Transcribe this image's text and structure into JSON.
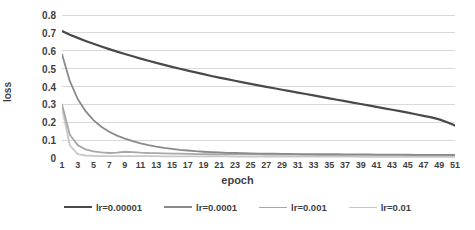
{
  "chart_data": {
    "type": "line",
    "title": "",
    "xlabel": "epoch",
    "ylabel": "loss",
    "xlim": [
      1,
      51
    ],
    "ylim": [
      0,
      0.8
    ],
    "grid": "horizontal",
    "legend_position": "bottom",
    "y_ticks": [
      "0.8",
      "0.7",
      "0.6",
      "0.5",
      "0.4",
      "0.3",
      "0.2",
      "0.1",
      "0"
    ],
    "y_tick_values": [
      0.8,
      0.7,
      0.6,
      0.5,
      0.4,
      0.3,
      0.2,
      0.1,
      0
    ],
    "x_ticks": [
      "1",
      "3",
      "5",
      "7",
      "9",
      "11",
      "13",
      "15",
      "17",
      "19",
      "21",
      "23",
      "25",
      "27",
      "29",
      "31",
      "33",
      "35",
      "37",
      "39",
      "41",
      "43",
      "45",
      "47",
      "49",
      "51"
    ],
    "x": [
      1,
      2,
      3,
      4,
      5,
      6,
      7,
      8,
      9,
      10,
      11,
      12,
      13,
      14,
      15,
      16,
      17,
      18,
      19,
      20,
      21,
      22,
      23,
      24,
      25,
      26,
      27,
      28,
      29,
      30,
      31,
      32,
      33,
      34,
      35,
      36,
      37,
      38,
      39,
      40,
      41,
      42,
      43,
      44,
      45,
      46,
      47,
      48,
      49,
      50,
      51
    ],
    "series": [
      {
        "name": "lr=0.00001",
        "color": "#4a4a4a",
        "width": 2.2,
        "values": [
          0.71,
          0.69,
          0.672,
          0.655,
          0.639,
          0.624,
          0.609,
          0.595,
          0.582,
          0.569,
          0.556,
          0.544,
          0.532,
          0.521,
          0.51,
          0.499,
          0.489,
          0.479,
          0.469,
          0.459,
          0.45,
          0.441,
          0.432,
          0.423,
          0.415,
          0.406,
          0.398,
          0.39,
          0.382,
          0.374,
          0.366,
          0.358,
          0.35,
          0.342,
          0.334,
          0.326,
          0.318,
          0.31,
          0.302,
          0.294,
          0.286,
          0.278,
          0.27,
          0.262,
          0.254,
          0.245,
          0.236,
          0.227,
          0.216,
          0.2,
          0.182
        ]
      },
      {
        "name": "lr=0.0001",
        "color": "#8a8a8a",
        "width": 1.8,
        "values": [
          0.58,
          0.43,
          0.33,
          0.262,
          0.212,
          0.175,
          0.147,
          0.125,
          0.108,
          0.094,
          0.082,
          0.072,
          0.064,
          0.057,
          0.051,
          0.046,
          0.042,
          0.038,
          0.035,
          0.033,
          0.031,
          0.029,
          0.028,
          0.027,
          0.026,
          0.025,
          0.024,
          0.024,
          0.023,
          0.023,
          0.022,
          0.022,
          0.022,
          0.021,
          0.021,
          0.021,
          0.02,
          0.02,
          0.02,
          0.02,
          0.019,
          0.019,
          0.019,
          0.019,
          0.019,
          0.018,
          0.018,
          0.018,
          0.018,
          0.018,
          0.017
        ]
      },
      {
        "name": "lr=0.001",
        "color": "#a8a8a8",
        "width": 1.8,
        "values": [
          0.3,
          0.13,
          0.072,
          0.048,
          0.037,
          0.031,
          0.028,
          0.03,
          0.035,
          0.033,
          0.03,
          0.028,
          0.027,
          0.026,
          0.025,
          0.024,
          0.023,
          0.022,
          0.022,
          0.021,
          0.021,
          0.021,
          0.02,
          0.02,
          0.02,
          0.02,
          0.019,
          0.019,
          0.019,
          0.019,
          0.019,
          0.018,
          0.018,
          0.018,
          0.018,
          0.018,
          0.018,
          0.017,
          0.017,
          0.017,
          0.017,
          0.017,
          0.017,
          0.017,
          0.016,
          0.016,
          0.016,
          0.016,
          0.016,
          0.016,
          0.016
        ]
      },
      {
        "name": "lr=0.01",
        "color": "#c8c8c8",
        "width": 1.8,
        "values": [
          0.28,
          0.07,
          0.022,
          0.014,
          0.012,
          0.011,
          0.011,
          0.01,
          0.01,
          0.01,
          0.01,
          0.01,
          0.01,
          0.009,
          0.009,
          0.009,
          0.009,
          0.009,
          0.009,
          0.009,
          0.009,
          0.009,
          0.008,
          0.008,
          0.008,
          0.008,
          0.008,
          0.008,
          0.008,
          0.008,
          0.008,
          0.008,
          0.008,
          0.008,
          0.008,
          0.008,
          0.008,
          0.008,
          0.007,
          0.007,
          0.007,
          0.007,
          0.007,
          0.007,
          0.007,
          0.007,
          0.007,
          0.007,
          0.007,
          0.007,
          0.007
        ]
      }
    ],
    "legend": [
      {
        "label": "lr=0.00001",
        "color": "#4a4a4a",
        "width": 2.6
      },
      {
        "label": "lr=0.0001",
        "color": "#8a8a8a",
        "width": 2.0
      },
      {
        "label": "lr=0.001",
        "color": "#a8a8a8",
        "width": 1.7
      },
      {
        "label": "lr=0.01",
        "color": "#c8c8c8",
        "width": 1.5
      }
    ],
    "gridline_color": "#d9d9d9",
    "text_color": "#3f3f3f"
  }
}
